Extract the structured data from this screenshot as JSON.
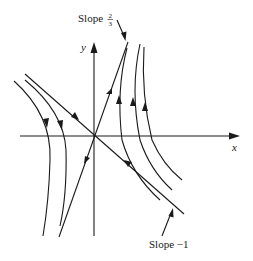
{
  "figure": {
    "type": "phase-portrait",
    "axes": {
      "x_label": "x",
      "y_label": "y"
    },
    "annotations": {
      "slope_top_prefix": "Slope",
      "slope_top_num": "2",
      "slope_top_den": "3",
      "slope_bottom": "Slope −1"
    },
    "colors": {
      "ink": "#1a1a1a",
      "background": "#ffffff"
    },
    "eigenlines": [
      {
        "name": "unstable-direction",
        "slope_label": "2/3",
        "flow": "outward"
      },
      {
        "name": "stable-direction",
        "slope_label": "-1",
        "flow": "inward"
      }
    ],
    "trajectories": {
      "left_family_count": 2,
      "left_family_flow": "downward",
      "right_family_count": 3,
      "right_family_flow": "upward"
    }
  }
}
